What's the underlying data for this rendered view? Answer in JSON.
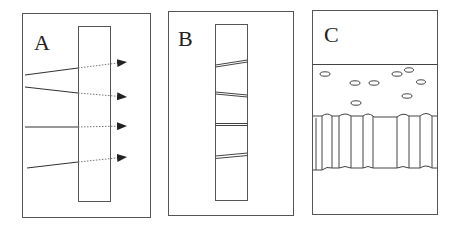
{
  "panels": [
    {
      "id": "A",
      "label": "A",
      "description": "Straight paths passing through a slab, continuing as dotted arrows"
    },
    {
      "id": "B",
      "label": "B",
      "description": "Slab crossed by four thin double-line slits at various angles"
    },
    {
      "id": "C",
      "label": "C",
      "description": "Dispersed small ellipses above a corrugated band structure"
    }
  ],
  "colors": {
    "stroke": "#333333",
    "dotted": "#777777",
    "background": "#ffffff"
  }
}
